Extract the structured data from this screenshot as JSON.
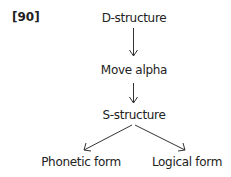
{
  "example_number": "[90]",
  "nodes": {
    "d_structure": "D-structure",
    "move_alpha": "Move alpha",
    "s_structure": "S-structure",
    "phonetic_form": "Phonetic form",
    "logical_form": "Logical form"
  },
  "edges": [
    {
      "from": "D-structure",
      "to": "Move alpha"
    },
    {
      "from": "Move alpha",
      "to": "S-structure"
    },
    {
      "from": "S-structure",
      "to": "Phonetic form"
    },
    {
      "from": "S-structure",
      "to": "Logical form"
    }
  ]
}
